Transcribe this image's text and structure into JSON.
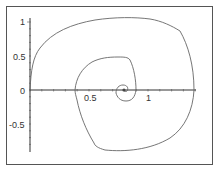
{
  "chart_data": {
    "type": "line",
    "title": "",
    "xlabel": "",
    "ylabel": "",
    "xlim": [
      0,
      1.4
    ],
    "ylim": [
      -0.9,
      1.05
    ],
    "grid": false,
    "legend": null,
    "x_ticks": [
      {
        "value": 0.5,
        "label": "0.5"
      },
      {
        "value": 1,
        "label": "1"
      }
    ],
    "y_ticks": [
      {
        "value": 1,
        "label": "1"
      },
      {
        "value": 0.5,
        "label": "0.5"
      },
      {
        "value": 0,
        "label": "0"
      },
      {
        "value": -0.5,
        "label": "-0.5"
      }
    ],
    "series": [
      {
        "name": "spiral",
        "color": "#666666",
        "points": [
          [
            0.0,
            0.0
          ],
          [
            0.02,
            0.2
          ],
          [
            0.08,
            0.45
          ],
          [
            0.2,
            0.7
          ],
          [
            0.4,
            0.88
          ],
          [
            0.6,
            0.96
          ],
          [
            0.8,
            0.98
          ],
          [
            1.0,
            0.93
          ],
          [
            1.2,
            0.72
          ],
          [
            1.35,
            0.35
          ],
          [
            1.38,
            0.0
          ],
          [
            1.33,
            -0.35
          ],
          [
            1.2,
            -0.62
          ],
          [
            1.0,
            -0.79
          ],
          [
            0.8,
            -0.87
          ],
          [
            0.6,
            -0.82
          ],
          [
            0.55,
            -0.77
          ],
          [
            0.5,
            -0.55
          ],
          [
            0.46,
            -0.25
          ],
          [
            0.45,
            0.0
          ],
          [
            0.5,
            0.25
          ],
          [
            0.62,
            0.43
          ],
          [
            0.8,
            0.48
          ],
          [
            0.92,
            0.47
          ],
          [
            0.98,
            0.3
          ],
          [
            1.0,
            0.0
          ],
          [
            0.97,
            -0.18
          ],
          [
            0.88,
            -0.2
          ],
          [
            0.78,
            -0.13
          ],
          [
            0.76,
            -0.02
          ],
          [
            0.78,
            0.08
          ],
          [
            0.85,
            0.08
          ],
          [
            0.84,
            0.0
          ],
          [
            0.81,
            0.0
          ]
        ]
      }
    ]
  },
  "axes": {
    "x_tick_labels": [
      "0.5",
      "1"
    ],
    "y_tick_labels": [
      "1",
      "0.5",
      "0",
      "-0.5"
    ]
  },
  "colors": {
    "frame": "#555555",
    "axis": "#333333",
    "curve": "#666666"
  }
}
